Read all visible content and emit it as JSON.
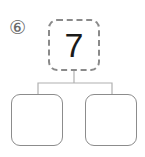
{
  "problem": {
    "number_label": "⑥",
    "top_value": "7",
    "bottom_left_value": "",
    "bottom_right_value": ""
  },
  "colors": {
    "box_border": "#8c8c8c",
    "dashed_border": "#8a8a8a",
    "connector": "#b0b0b0",
    "text": "#1a1a1a"
  }
}
